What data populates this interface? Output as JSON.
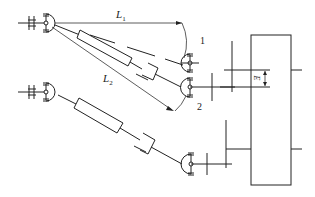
{
  "diagram": {
    "type": "mechanical-schematic",
    "labels": {
      "L1": {
        "main": "L",
        "sub": "1"
      },
      "L2": {
        "main": "L",
        "sub": "2"
      },
      "pos1": "1",
      "pos2": "2",
      "offset": "E"
    },
    "colors": {
      "line": "#222222",
      "background": "#ffffff"
    }
  }
}
